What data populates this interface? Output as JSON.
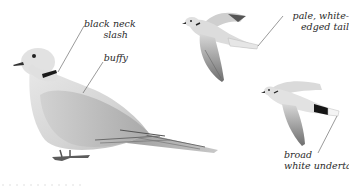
{
  "plate": {
    "subject": "Eurasian Collared-Dove field guide illustration",
    "colors": {
      "background": "#ffffff",
      "plumage_light": "#e4e4e4",
      "plumage_mid": "#c9c9c9",
      "plumage_dark": "#8a8a8a",
      "neck_slash": "#1a1a1a",
      "label_text": "#2a2a2a",
      "leader_line": "#555555"
    },
    "figures": [
      {
        "id": "perched",
        "pose": "perched side view"
      },
      {
        "id": "flight-upper",
        "pose": "flying, upperside"
      },
      {
        "id": "flight-under",
        "pose": "flying, underside"
      }
    ],
    "labels": {
      "neck": {
        "line1": "black neck",
        "line2": "slash"
      },
      "buffy": {
        "line1": "buffy"
      },
      "tail_upper": {
        "line1": "pale, white-",
        "line2": "edged tail"
      },
      "undertail": {
        "line1": "broad",
        "line2": "white undertail"
      }
    }
  }
}
